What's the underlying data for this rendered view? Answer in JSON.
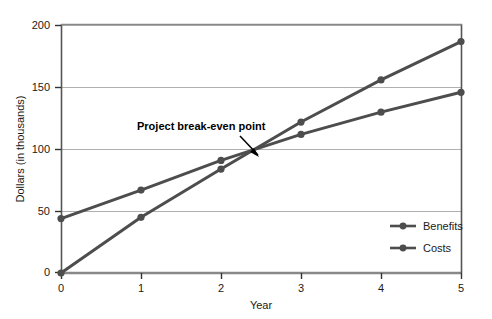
{
  "chart_data": {
    "type": "line",
    "title": "",
    "xlabel": "Year",
    "ylabel": "Dollars (in thousands)",
    "x": [
      0,
      1,
      2,
      3,
      4,
      5
    ],
    "xticklabels": [
      "0",
      "1",
      "2",
      "3",
      "4",
      "5"
    ],
    "yticklabels": [
      "0",
      "50",
      "100",
      "150",
      "200"
    ],
    "yticks": [
      0,
      50,
      100,
      150,
      200
    ],
    "xlim": [
      0,
      5
    ],
    "ylim": [
      0,
      210
    ],
    "grid": "horizontal",
    "legend_position": "lower-right",
    "series": [
      {
        "name": "Benefits",
        "color": "#4d4d4d",
        "values": [
          0,
          45,
          84,
          122,
          156,
          187
        ]
      },
      {
        "name": "Costs",
        "color": "#4d4d4d",
        "values": [
          44,
          67,
          91,
          112,
          130,
          146
        ]
      }
    ],
    "annotations": [
      {
        "text": "Project break-even point",
        "x": 2.45,
        "y": 100
      }
    ]
  },
  "legend": {
    "items": [
      {
        "label": "Benefits"
      },
      {
        "label": "Costs"
      }
    ]
  },
  "axes": {
    "y_title": "Dollars (in thousands)",
    "x_title": "Year",
    "y_ticks": [
      "200",
      "150",
      "100",
      "50",
      "0"
    ],
    "x_ticks": [
      "0",
      "1",
      "2",
      "3",
      "4",
      "5"
    ]
  },
  "annotation": {
    "text": "Project break-even point"
  },
  "colors": {
    "line": "#4d4d4d",
    "grid": "#b0b0b0",
    "frame": "#555555",
    "text": "#1a1a1a"
  }
}
